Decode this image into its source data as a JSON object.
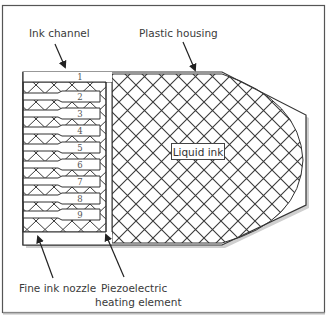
{
  "diagram": {
    "type": "inkjet print head cross-section",
    "labels": {
      "ink_channel": "Ink channel",
      "plastic_housing": "Plastic housing",
      "liquid_ink": "Liquid ink",
      "fine_ink_nozzle": "Fine ink nozzle",
      "piezo_line1": "Piezoelectric",
      "piezo_line2": "heating element"
    },
    "channel_numbers": [
      "1",
      "2",
      "3",
      "4",
      "5",
      "6",
      "7",
      "8",
      "9"
    ],
    "colors": {
      "line": "#333333",
      "hatch": "#3a3a3a",
      "background": "#ffffff",
      "shadow": "#c8c8c8"
    }
  }
}
